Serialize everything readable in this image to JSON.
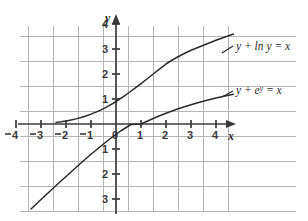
{
  "figure": {
    "background_color": "#ffffff",
    "grid_color": "#b6b6b6",
    "axis_color": "#3a3a3a",
    "curve_color": "#2b2b2b"
  },
  "axes": {
    "x_axis_label": "x",
    "y_axis_label": "y",
    "x_ticks": [
      {
        "value": -4,
        "label": "4",
        "minus": true
      },
      {
        "value": -3,
        "label": "3",
        "minus": true
      },
      {
        "value": -2,
        "label": "2",
        "minus": true
      },
      {
        "value": -1,
        "label": "1",
        "minus": true
      },
      {
        "value": 0,
        "label": "0",
        "minus": false
      },
      {
        "value": 1,
        "label": "1",
        "minus": false
      },
      {
        "value": 2,
        "label": "2",
        "minus": false
      },
      {
        "value": 3,
        "label": "3",
        "minus": false
      },
      {
        "value": 4,
        "label": "4",
        "minus": false
      }
    ],
    "y_ticks": [
      {
        "value": 4,
        "label": "4"
      },
      {
        "value": 3,
        "label": "3"
      },
      {
        "value": 2,
        "label": "2"
      },
      {
        "value": 1,
        "label": "1"
      },
      {
        "value": -1,
        "label": "1"
      },
      {
        "value": -2,
        "label": "2"
      },
      {
        "value": -3,
        "label": "3"
      }
    ]
  },
  "curve_labels": {
    "upper_prefix": "y + ",
    "upper_func": "ln",
    "upper_suffix": " y = x",
    "lower_prefix": "y + ",
    "lower_base": "e",
    "lower_exponent": "y",
    "lower_suffix": " = x"
  },
  "chart_data": {
    "type": "line",
    "title": "",
    "xlabel": "x",
    "ylabel": "y",
    "xlim": [
      -4.6,
      4.9
    ],
    "ylim": [
      -3.6,
      4.3
    ],
    "grid": true,
    "legend": "inline-curve-labels",
    "xticks": [
      -4,
      -3,
      -2,
      -1,
      0,
      1,
      2,
      3,
      4
    ],
    "yticks": [
      -3,
      -2,
      -1,
      1,
      2,
      3,
      4
    ],
    "series": [
      {
        "name": "y + ln y = x",
        "label_position": {
          "x": 5.0,
          "y": 3.25
        },
        "points": [
          [
            -2.4,
            0.065
          ],
          [
            -2.2,
            0.09
          ],
          [
            -2.0,
            0.12
          ],
          [
            -1.8,
            0.16
          ],
          [
            -1.6,
            0.205
          ],
          [
            -1.4,
            0.258
          ],
          [
            -1.2,
            0.32
          ],
          [
            -1.0,
            0.393
          ],
          [
            -0.8,
            0.475
          ],
          [
            -0.6,
            0.567
          ],
          [
            -0.4,
            0.668
          ],
          [
            -0.2,
            0.779
          ],
          [
            0.0,
            0.9
          ],
          [
            0.25,
            1.065
          ],
          [
            0.5,
            1.24
          ],
          [
            0.75,
            1.425
          ],
          [
            1.0,
            1.615
          ],
          [
            1.25,
            1.81
          ],
          [
            1.5,
            2.01
          ],
          [
            1.75,
            2.205
          ],
          [
            2.0,
            2.4
          ],
          [
            2.25,
            2.56
          ],
          [
            2.5,
            2.7
          ],
          [
            2.75,
            2.83
          ],
          [
            3.0,
            2.95
          ],
          [
            3.25,
            3.05
          ],
          [
            3.5,
            3.15
          ],
          [
            3.75,
            3.25
          ],
          [
            4.0,
            3.35
          ],
          [
            4.25,
            3.44
          ],
          [
            4.5,
            3.53
          ],
          [
            4.7,
            3.6
          ]
        ]
      },
      {
        "name": "y + e^y = x",
        "label_position": {
          "x": 5.0,
          "y": 1.35
        },
        "points": [
          [
            -3.4,
            -3.4
          ],
          [
            -3.0,
            -3.02
          ],
          [
            -2.6,
            -2.65
          ],
          [
            -2.2,
            -2.28
          ],
          [
            -1.8,
            -1.92
          ],
          [
            -1.4,
            -1.56
          ],
          [
            -1.0,
            -1.21
          ],
          [
            -0.6,
            -0.88
          ],
          [
            -0.2,
            -0.56
          ],
          [
            0.2,
            -0.27
          ],
          [
            0.6,
            -0.02
          ],
          [
            1.0,
            0.0
          ],
          [
            1.2,
            0.09
          ],
          [
            1.6,
            0.27
          ],
          [
            2.0,
            0.43
          ],
          [
            2.4,
            0.58
          ],
          [
            2.8,
            0.71
          ],
          [
            3.2,
            0.83
          ],
          [
            3.6,
            0.94
          ],
          [
            4.0,
            1.04
          ],
          [
            4.4,
            1.13
          ],
          [
            4.7,
            1.19
          ]
        ]
      }
    ]
  }
}
